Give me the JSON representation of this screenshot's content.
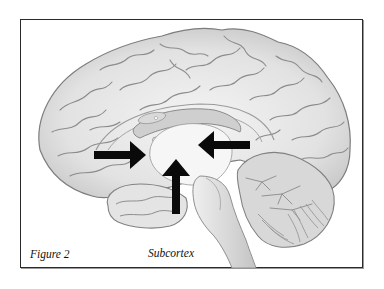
{
  "figure": {
    "label": "Figure 2",
    "caption": "Subcortex",
    "arrows": [
      {
        "id": "arrow-left",
        "direction": "right",
        "target": "thalamus-region"
      },
      {
        "id": "arrow-right",
        "direction": "left",
        "target": "thalamus-region"
      },
      {
        "id": "arrow-bottom",
        "direction": "up",
        "target": "hypothalamus-region"
      }
    ],
    "colors": {
      "frame": "#2a2a2a",
      "arrow": "#0a0a0a",
      "brain_fill": "#e9e9e9",
      "brain_shade": "#bdbdbd",
      "gyri_line": "#8c8c8c"
    }
  }
}
